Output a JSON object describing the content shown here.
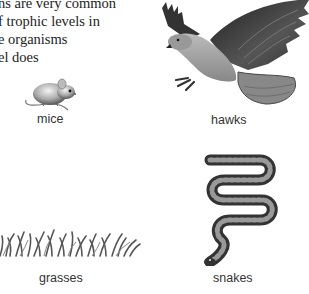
{
  "paragraph": {
    "lines": [
      "ns are very common",
      "f trophic levels in",
      "e organisms",
      "el does"
    ]
  },
  "organisms": [
    {
      "label": "mice",
      "icon": "mouse-illustration"
    },
    {
      "label": "hawks",
      "icon": "hawk-illustration"
    },
    {
      "label": "grasses",
      "icon": "grass-illustration"
    },
    {
      "label": "snakes",
      "icon": "snake-illustration"
    }
  ],
  "colors": {
    "text": "#222222",
    "illustration": "#444444",
    "background": "#ffffff"
  }
}
